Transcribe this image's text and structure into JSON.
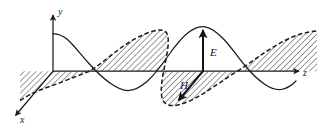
{
  "figure": {
    "background_color": "#ffffff",
    "stroke_color": "#1a1a1a",
    "hatch_color": "#4a4a4a",
    "width": 317,
    "height": 127
  },
  "axes": {
    "origin": {
      "x": 53,
      "y": 71
    },
    "y_axis": {
      "label": "y",
      "from": {
        "x": 53,
        "y": 71
      },
      "to": {
        "x": 53,
        "y": 14
      },
      "label_pos": {
        "x": 58,
        "y": 12
      },
      "arrow": "up"
    },
    "z_axis": {
      "label": "z",
      "from": {
        "x": 53,
        "y": 71
      },
      "to": {
        "x": 300,
        "y": 71
      },
      "label_pos": {
        "x": 304,
        "y": 75
      },
      "arrow": "right"
    },
    "x_axis": {
      "label": "x",
      "from": {
        "x": 53,
        "y": 71
      },
      "to": {
        "x": 14,
        "y": 117
      },
      "label_pos": {
        "x": 21,
        "y": 122
      },
      "arrow": "down-left"
    }
  },
  "vectors": [
    {
      "name": "E",
      "label": "E",
      "description": "electric field vector, vertical, in the y-z plane",
      "tail": {
        "x": 203,
        "y": 71
      },
      "head": {
        "x": 203,
        "y": 28
      },
      "label_pos": {
        "x": 210,
        "y": 52
      },
      "style": "solid"
    },
    {
      "name": "H",
      "label": "H",
      "description": "magnetic field vector, toward lower-left along x, in the x-z plane",
      "tail": {
        "x": 203,
        "y": 71
      },
      "head": {
        "x": 176,
        "y": 103
      },
      "label_pos": {
        "x": 181,
        "y": 86
      },
      "style": "solid"
    }
  ],
  "curves": {
    "electric_wave": {
      "name": "E-field sine wave",
      "style": "solid",
      "plane": "y-z",
      "description": "sinusoid drawn in the vertical y-z plane; starts at a crest at the y-axis",
      "amplitude_px": 43,
      "wavelength_px": 148,
      "phase": "cosine",
      "z_start": 53,
      "z_end": 300,
      "baseline_y": 71
    },
    "magnetic_wave": {
      "name": "H-field sine wave",
      "style": "dashed",
      "plane": "x-z",
      "description": "sinusoid drawn in the perspective x-z plane, hatched to the z-axis; in phase with E",
      "amplitude_px": 43,
      "wavelength_px": 148,
      "phase": "cosine",
      "z_start": 20,
      "z_end": 317,
      "perspective_dx": -39,
      "perspective_dy": 46,
      "baseline_y": 71
    }
  },
  "shading": {
    "name": "hatched-region",
    "description": "diagonal line hatching between the z-axis and the dashed magnetic-field curve",
    "pattern": "diagonal-lines",
    "angle_deg": 45,
    "spacing_px": 3
  }
}
